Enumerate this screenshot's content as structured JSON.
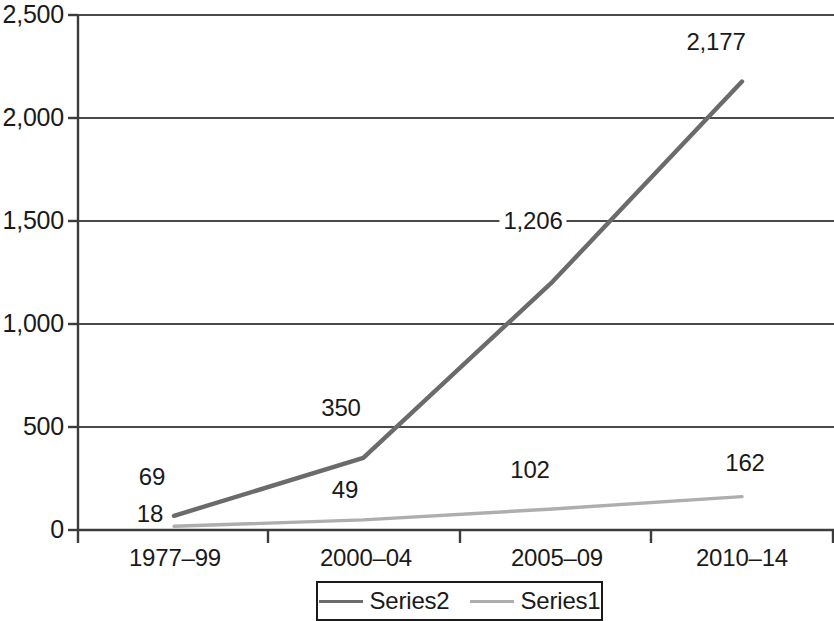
{
  "chart_data": {
    "type": "line",
    "title": "",
    "subtitle": "",
    "xlabel": "",
    "ylabel": "",
    "categories": [
      "1977–99",
      "2000–04",
      "2005–09",
      "2010–14"
    ],
    "series": [
      {
        "name": "Series2",
        "color": "#6b6b6b",
        "values": [
          69,
          350,
          1206,
          2177
        ],
        "labels": [
          "69",
          "350",
          "1,206",
          "2,177"
        ]
      },
      {
        "name": "Series1",
        "color": "#aeaeae",
        "values": [
          18,
          49,
          102,
          162
        ],
        "labels": [
          "18",
          "49",
          "102",
          "162"
        ]
      }
    ],
    "ylim": [
      0,
      2500
    ],
    "yticks": [
      0,
      500,
      1000,
      1500,
      2000,
      2500
    ],
    "ytick_labels": [
      "0",
      "500",
      "1,000",
      "1,500",
      "2,000",
      "2,500"
    ],
    "grid": true,
    "grid_axis": "y",
    "legend_position": "bottom",
    "legend_entries": [
      "Series2",
      "Series1"
    ],
    "axis_color": "#3c3c3c",
    "grid_color": "#4a4a4a",
    "background": "#ffffff"
  }
}
